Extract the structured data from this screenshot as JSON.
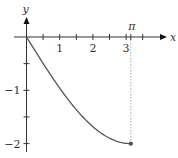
{
  "chart_data": {
    "type": "line",
    "title": "",
    "xlabel": "x",
    "ylabel": "y",
    "xlim": [
      -0.3,
      4.2
    ],
    "ylim": [
      -2.25,
      0.7
    ],
    "x_ticks": [
      0.5,
      1,
      1.5,
      2,
      2.5,
      3,
      3.5
    ],
    "x_tick_labels": [
      {
        "value": 1,
        "label": "1"
      },
      {
        "value": 2,
        "label": "2"
      },
      {
        "value": 3,
        "label": "3"
      }
    ],
    "x_special_tick": {
      "value": 3.14159,
      "label": "π"
    },
    "y_ticks": [
      -0.5,
      -1,
      -1.5,
      -2
    ],
    "y_tick_labels": [
      {
        "value": -1,
        "label": "−1"
      },
      {
        "value": -2,
        "label": "−2"
      }
    ],
    "grid": false,
    "series": [
      {
        "name": "curve",
        "color": "#555555",
        "function": "-2*sin(x/2)",
        "x": [
          0,
          0.25,
          0.5,
          0.75,
          1,
          1.25,
          1.5,
          1.75,
          2,
          2.25,
          2.5,
          2.75,
          3,
          3.14159
        ],
        "y": [
          0,
          -0.249,
          -0.495,
          -0.732,
          -0.959,
          -1.17,
          -1.364,
          -1.537,
          -1.683,
          -1.804,
          -1.898,
          -1.962,
          -1.995,
          -2
        ]
      }
    ],
    "endpoint": {
      "x": 3.14159,
      "y": -2
    },
    "guide_color": "#aaaaaa"
  }
}
